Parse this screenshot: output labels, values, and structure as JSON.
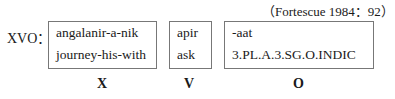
{
  "citation": "（Fortescue 1984：92）",
  "order_label": "XVO：",
  "constituents": [
    {
      "role": "X",
      "morphemes": "angalanir-a-nik",
      "gloss": "journey-his-with"
    },
    {
      "role": "V",
      "morphemes": "apir",
      "gloss": "ask"
    },
    {
      "role": "O",
      "morphemes": "-aat",
      "gloss": "3.PL.A.3.SG.O.INDIC"
    }
  ]
}
